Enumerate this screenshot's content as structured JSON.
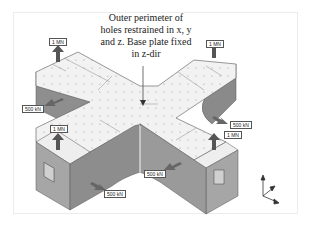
{
  "annotation": {
    "lines": [
      "Outer perimeter of",
      "holes restrained in x, y",
      "and z. Base plate fixed",
      "in z-dir"
    ]
  },
  "load_labels": {
    "top_left_vertical": "1 MN",
    "top_right_vertical": "1 MN",
    "left_arm_horizontal": "500 kN",
    "front_left_vertical": "1 MN",
    "right_arm_horizontal": "500 kN",
    "front_right_vertical": "1 MN",
    "inner_corner_horizontal": "500 kN",
    "front_bottom_horizontal": "500 kN"
  },
  "axis_triad": {
    "axes": [
      "z",
      "y",
      "x"
    ]
  },
  "colors": {
    "plate_top": "#f2f2f2",
    "wall_side": "#8f8f8f",
    "wall_front": "#a9a9a9",
    "arrow": "#555555"
  }
}
